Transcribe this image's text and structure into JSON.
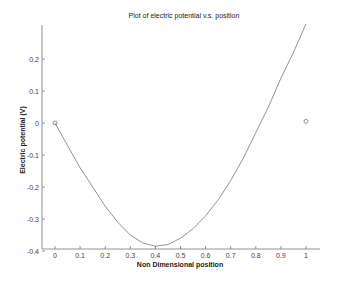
{
  "chart_data": {
    "type": "line",
    "title": "Plot of electric potential v.s. position",
    "xlabel": "Non Dimensional position",
    "ylabel": "Electric potential (V)",
    "xlim": [
      -0.05,
      1.0
    ],
    "ylim": [
      -0.4,
      0.3
    ],
    "grid": false,
    "legend": null,
    "x_ticks": [
      "0",
      "0.1",
      "0.2",
      "0.3",
      "0.4",
      "0.5",
      "0.6",
      "0.7",
      "0.8",
      "0.9",
      "1"
    ],
    "y_ticks": [
      "0.2",
      "0.1",
      "0",
      "-0.1",
      "-0.2",
      "-0.3",
      "-0.4"
    ],
    "series": [
      {
        "name": "potential curve",
        "style": "line",
        "x": [
          0,
          0.05,
          0.1,
          0.15,
          0.2,
          0.25,
          0.3,
          0.35,
          0.4,
          0.45,
          0.5,
          0.55,
          0.6,
          0.65,
          0.7,
          0.75,
          0.8,
          0.85,
          0.9,
          0.95,
          1.0
        ],
        "y": [
          0,
          -0.07,
          -0.14,
          -0.2,
          -0.26,
          -0.31,
          -0.35,
          -0.375,
          -0.385,
          -0.38,
          -0.36,
          -0.33,
          -0.29,
          -0.24,
          -0.18,
          -0.11,
          -0.03,
          0.05,
          0.14,
          0.22,
          0.31
        ]
      },
      {
        "name": "boundary points",
        "style": "marker-circle",
        "x": [
          0,
          1
        ],
        "y": [
          0,
          0.005
        ]
      }
    ]
  }
}
